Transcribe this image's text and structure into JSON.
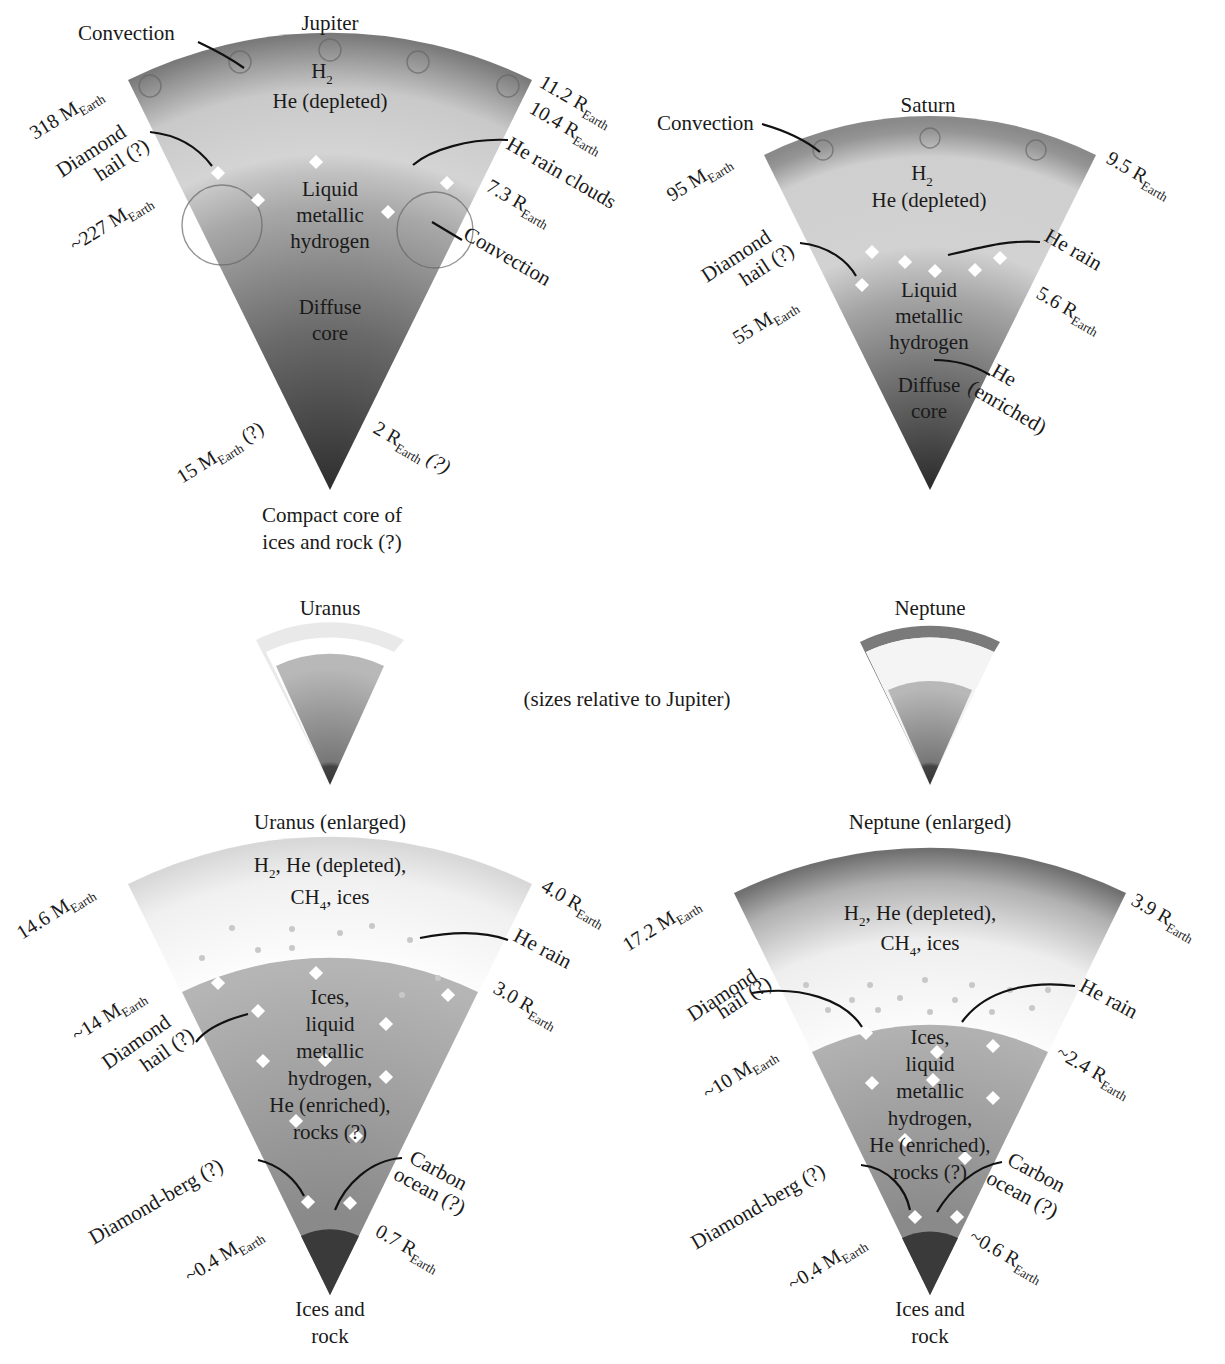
{
  "figure": {
    "caption_note": "(sizes relative to Jupiter)"
  },
  "jupiter": {
    "title": "Jupiter",
    "layers": {
      "outer": [
        "H",
        "2",
        "He (depleted)"
      ],
      "middle": [
        "Liquid",
        "metallic",
        "hydrogen"
      ],
      "inner": [
        "Diffuse",
        "core"
      ],
      "center": [
        "Compact core of",
        "ices and rock (?)"
      ]
    },
    "annotations": {
      "convection_top": "Convection",
      "diamond_hail": [
        "Diamond",
        "hail (?)"
      ],
      "he_rain_clouds": "He rain clouds",
      "convection_mid": "Convection"
    },
    "mass_labels": [
      {
        "value": "318 M",
        "sub": "Earth"
      },
      {
        "value": "~227 M",
        "sub": "Earth"
      },
      {
        "value": "15 M",
        "sub": "Earth",
        "suffix": " (?)"
      }
    ],
    "radius_labels": [
      {
        "value": "11.2 R",
        "sub": "Earth"
      },
      {
        "value": "10.4 R",
        "sub": "Earth"
      },
      {
        "value": "7.3 R",
        "sub": "Earth"
      },
      {
        "value": "2 R",
        "sub": "Earth",
        "suffix": " (?)"
      }
    ]
  },
  "saturn": {
    "title": "Saturn",
    "layers": {
      "outer": [
        "H",
        "2",
        "He (depleted)"
      ],
      "middle": [
        "Liquid",
        "metallic",
        "hydrogen"
      ],
      "inner": [
        "Diffuse",
        "core"
      ]
    },
    "annotations": {
      "convection": "Convection",
      "diamond_hail": [
        "Diamond",
        "hail (?)"
      ],
      "he_rain": "He rain",
      "he_enriched": [
        "He",
        "(enriched)"
      ]
    },
    "mass_labels": [
      {
        "value": "95 M",
        "sub": "Earth"
      },
      {
        "value": "55 M",
        "sub": "Earth"
      }
    ],
    "radius_labels": [
      {
        "value": "9.5 R",
        "sub": "Earth"
      },
      {
        "value": "5.6 R",
        "sub": "Earth"
      }
    ]
  },
  "uranus_small": {
    "title": "Uranus"
  },
  "neptune_small": {
    "title": "Neptune"
  },
  "uranus": {
    "title": "Uranus (enlarged)",
    "layers": {
      "outer": [
        "H",
        "2",
        ", He (depleted),",
        "CH",
        "4",
        ", ices"
      ],
      "middle": [
        "Ices,",
        "liquid",
        "metallic",
        "hydrogen,",
        "He (enriched),",
        "rocks (?)"
      ],
      "center": [
        "Ices and",
        "rock"
      ]
    },
    "annotations": {
      "he_rain": "He rain",
      "diamond_hail": [
        "Diamond",
        "hail (?)"
      ],
      "diamond_berg": "Diamond-berg (?)",
      "carbon_ocean": [
        "Carbon",
        "ocean (?)"
      ]
    },
    "mass_labels": [
      {
        "value": "14.6 M",
        "sub": "Earth"
      },
      {
        "value": "~14 M",
        "sub": "Earth"
      },
      {
        "value": "~0.4 M",
        "sub": "Earth"
      }
    ],
    "radius_labels": [
      {
        "value": "4.0 R",
        "sub": "Earth"
      },
      {
        "value": "3.0 R",
        "sub": "Earth"
      },
      {
        "value": "0.7 R",
        "sub": "Earth"
      }
    ]
  },
  "neptune": {
    "title": "Neptune (enlarged)",
    "layers": {
      "outer": [
        "H",
        "2",
        ", He (depleted),",
        "CH",
        "4",
        ", ices"
      ],
      "middle": [
        "Ices,",
        "liquid",
        "metallic",
        "hydrogen,",
        "He (enriched),",
        "rocks (?)"
      ],
      "center": [
        "Ices and",
        "rock"
      ]
    },
    "annotations": {
      "diamond_hail": [
        "Diamond",
        "hail (?)"
      ],
      "he_rain": "He rain",
      "diamond_berg": "Diamond-berg (?)",
      "carbon_ocean": [
        "Carbon",
        "ocean (?)"
      ]
    },
    "mass_labels": [
      {
        "value": "17.2 M",
        "sub": "Earth"
      },
      {
        "value": "~10 M",
        "sub": "Earth"
      },
      {
        "value": "~0.4 M",
        "sub": "Earth"
      }
    ],
    "radius_labels": [
      {
        "value": "3.9 R",
        "sub": "Earth"
      },
      {
        "value": "~2.4 R",
        "sub": "Earth"
      },
      {
        "value": "~0.6 R",
        "sub": "Earth"
      }
    ]
  },
  "colors": {
    "background": "#ffffff",
    "text": "#1a1a1a",
    "outer_dark": "#8c8c8c",
    "layer_light": "#d8d8d8",
    "layer_mid": "#a9a9a9",
    "core_dark": "#3a3a3a",
    "diamond": "#ffffff"
  }
}
